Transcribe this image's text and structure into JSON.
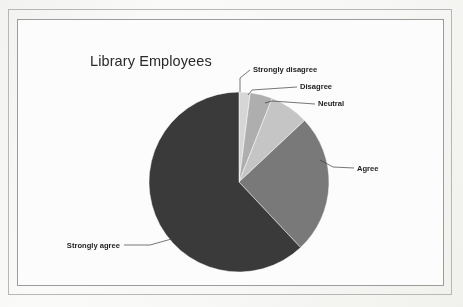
{
  "page": {
    "background_color": "#fdfdfc",
    "frame_outer_color": "#b9b9b9",
    "frame_inner_color": "#9e9e9e"
  },
  "chart_data": {
    "type": "pie",
    "title": "Library Employees",
    "subtitle": "",
    "xlabel": "",
    "ylabel": "",
    "legend_position": "none",
    "labels_position": "outside-with-leader-lines",
    "grid": false,
    "start_angle_deg": 0,
    "direction": "clockwise",
    "categories": [
      "Strongly disagree",
      "Disagree",
      "Neutral",
      "Agree",
      "Strongly agree"
    ],
    "values": [
      2,
      4,
      7,
      25,
      62
    ],
    "value_unit": "percent",
    "colors": [
      "#d9d9d9",
      "#b0b0b0",
      "#c8c8c8",
      "#7a7a7a",
      "#3a3a3a"
    ],
    "slices": [
      {
        "label": "Strongly disagree",
        "value": 2,
        "color": "#d9d9d9",
        "start_angle_deg": 0,
        "end_angle_deg": 7.2,
        "label_x": 253,
        "label_y": 72,
        "label_anchor": "start",
        "leader_path": "M 240 92 L 240 78 L 250 70"
      },
      {
        "label": "Disagree",
        "value": 4,
        "color": "#b0b0b0",
        "start_angle_deg": 7.2,
        "end_angle_deg": 21.6,
        "label_x": 300,
        "label_y": 89,
        "label_anchor": "start",
        "leader_path": "M 248 95 L 252 90 L 297 87"
      },
      {
        "label": "Neutral",
        "value": 7,
        "color": "#c8c8c8",
        "start_angle_deg": 21.6,
        "end_angle_deg": 46.8,
        "label_x": 318,
        "label_y": 106,
        "label_anchor": "start",
        "leader_path": "M 265 103 L 272 101 L 315 104"
      },
      {
        "label": "Agree",
        "value": 25,
        "color": "#7a7a7a",
        "start_angle_deg": 46.8,
        "end_angle_deg": 136.8,
        "label_x": 357,
        "label_y": 171,
        "label_anchor": "start",
        "leader_path": "M 320 160 L 333 167 L 354 168"
      },
      {
        "label": "Strongly agree",
        "value": 62,
        "color": "#3a3a3a",
        "start_angle_deg": 136.8,
        "end_angle_deg": 360,
        "label_x": 120,
        "label_y": 248,
        "label_anchor": "end",
        "leader_path": "M 175 238 L 150 245 L 124 245"
      }
    ],
    "geometry": {
      "center_x": 239,
      "center_y": 182,
      "radius": 90
    }
  }
}
